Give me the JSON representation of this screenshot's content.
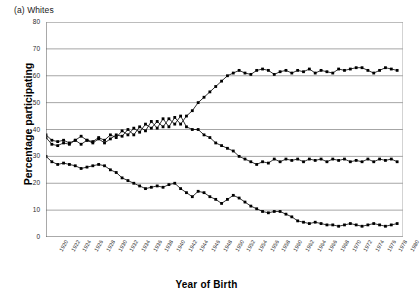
{
  "panel": {
    "title": "(a) Whites"
  },
  "axes": {
    "ylabel": "Percentage participating",
    "xlabel": "Year of Birth",
    "yticks": [
      0,
      10,
      20,
      30,
      40,
      50,
      60,
      70,
      80
    ],
    "xticks": [
      1920,
      1922,
      1924,
      1926,
      1928,
      1930,
      1932,
      1934,
      1936,
      1938,
      1940,
      1942,
      1944,
      1946,
      1948,
      1950,
      1952,
      1954,
      1956,
      1958,
      1960,
      1962,
      1964,
      1966,
      1968,
      1970,
      1972,
      1974,
      1976,
      1978,
      1980
    ]
  },
  "style": {
    "gridline_color": "#a6a6a6",
    "axis_color": "#555555",
    "series_color": "#000000",
    "marker_color": "#000000",
    "background": "#ffffff"
  },
  "chart_data": {
    "type": "line",
    "title": "(a) Whites",
    "xlabel": "Year of Birth",
    "ylabel": "Percentage participating",
    "xlim": [
      1920,
      1981
    ],
    "ylim": [
      0,
      80
    ],
    "grid": true,
    "legend": "none",
    "marker": "filled-square",
    "x": [
      1920,
      1921,
      1922,
      1923,
      1924,
      1925,
      1926,
      1927,
      1928,
      1929,
      1930,
      1931,
      1932,
      1933,
      1934,
      1935,
      1936,
      1937,
      1938,
      1939,
      1940,
      1941,
      1942,
      1943,
      1944,
      1945,
      1946,
      1947,
      1948,
      1949,
      1950,
      1951,
      1952,
      1953,
      1954,
      1955,
      1956,
      1957,
      1958,
      1959,
      1960,
      1961,
      1962,
      1963,
      1964,
      1965,
      1966,
      1967,
      1968,
      1969,
      1970,
      1971,
      1972,
      1973,
      1974,
      1975,
      1976,
      1977,
      1978,
      1979,
      1980
    ],
    "series": [
      {
        "name": "rising-series",
        "values": [
          37,
          34.5,
          34,
          35,
          34.5,
          36,
          37.5,
          36,
          35,
          36.5,
          35,
          36.5,
          38,
          37.5,
          40,
          38,
          41,
          39.5,
          43,
          40.5,
          44,
          41,
          44.5,
          42,
          45,
          47,
          50,
          52,
          54,
          56,
          58,
          60,
          61,
          62,
          61,
          60.5,
          62,
          62.5,
          62,
          60.5,
          61.5,
          62,
          61,
          62,
          61.5,
          62.5,
          61,
          62,
          61.5,
          61,
          62.5,
          62,
          62.5,
          63,
          63,
          62,
          61,
          62,
          63,
          62.5,
          62
        ]
      },
      {
        "name": "declining-stable-series",
        "values": [
          38,
          36,
          35.5,
          36,
          35,
          36,
          34.5,
          36,
          35.5,
          37,
          36,
          38,
          37,
          39.5,
          38,
          40.5,
          39,
          42,
          40.5,
          43,
          41,
          44,
          42,
          45,
          41,
          40,
          40,
          38,
          37,
          35,
          34,
          33,
          32,
          30,
          29,
          28,
          27,
          28,
          27.5,
          29,
          28,
          29,
          28.5,
          29,
          28,
          29,
          28.5,
          29,
          28,
          29,
          28.5,
          29,
          28,
          28.5,
          28,
          29,
          28,
          29,
          28.5,
          29,
          28
        ]
      },
      {
        "name": "steeply-declining-series",
        "values": [
          30,
          28,
          27,
          27.5,
          27,
          26.5,
          25.5,
          26,
          26.5,
          27,
          26.5,
          25,
          24,
          22,
          21,
          20,
          19,
          18,
          18.5,
          19,
          18.5,
          19.5,
          20,
          18,
          16.5,
          15,
          17,
          16.5,
          15,
          14,
          12.5,
          14,
          15.5,
          14.5,
          13,
          11.5,
          10.5,
          9.5,
          9,
          9.5,
          9.5,
          8.5,
          7.5,
          6,
          5.5,
          5,
          5.5,
          5,
          4.5,
          4.5,
          4,
          4.5,
          5,
          4.5,
          4,
          4.5,
          5,
          4.5,
          4,
          4.5,
          5
        ]
      }
    ]
  }
}
